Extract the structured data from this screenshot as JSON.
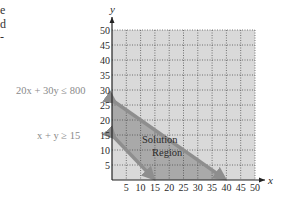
{
  "left_fragments": [
    "e",
    "d",
    "-"
  ],
  "chart_data": {
    "type": "area",
    "title": "",
    "xlabel": "x",
    "ylabel": "y",
    "xlim": [
      0,
      50
    ],
    "ylim": [
      0,
      50
    ],
    "xticks": [
      5,
      10,
      15,
      20,
      25,
      30,
      35,
      40,
      45,
      50
    ],
    "yticks": [
      5,
      10,
      15,
      20,
      25,
      30,
      35,
      40,
      45,
      50
    ],
    "grid": true,
    "constraints": [
      {
        "label": "20x + 30y ≤ 800",
        "line": {
          "a": 20,
          "b": 30,
          "c": 800
        },
        "x_intercept": 40,
        "y_intercept": 26.67
      },
      {
        "label": "x + y ≥ 15",
        "line": {
          "a": 1,
          "b": 1,
          "c": 15
        },
        "x_intercept": 15,
        "y_intercept": 15
      }
    ],
    "region_label": [
      "Solution",
      "Region"
    ],
    "solution_region_vertices": [
      [
        0,
        15
      ],
      [
        0,
        26.67
      ],
      [
        40,
        0
      ],
      [
        15,
        0
      ]
    ]
  },
  "colors": {
    "background": "#d9d9d9",
    "solution_region": "#a9a9a9",
    "line_band": "#8e8e8e",
    "grid": "#444444",
    "axis": "#222222"
  }
}
